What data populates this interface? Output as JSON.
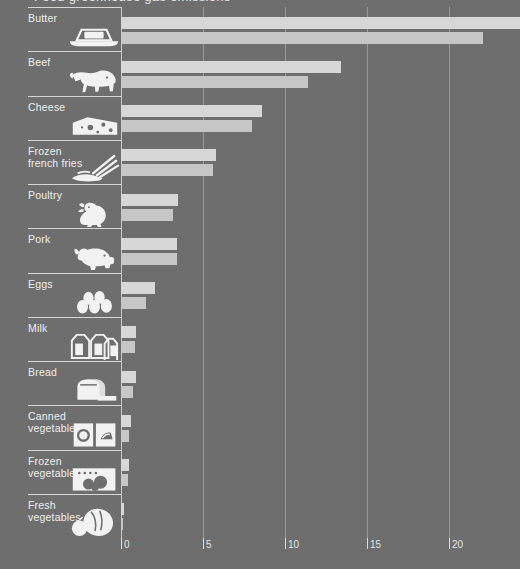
{
  "title": "Food greenhouse gas emissions",
  "axis": {
    "ticks": [
      "0",
      "5",
      "10",
      "15",
      "20"
    ],
    "tick_values": [
      0,
      5,
      10,
      15,
      20
    ],
    "min": 0,
    "max": 24.3
  },
  "colors": {
    "background": "#6e6e6e",
    "series_1": "#d7d7d7",
    "series_2": "#c6c6c6",
    "gridline": "#9a9a9a",
    "baseline": "#c9c9c9",
    "text": "#efefef"
  },
  "chart_data": {
    "type": "bar",
    "orientation": "horizontal",
    "title": "Food greenhouse gas emissions",
    "xlabel": "",
    "ylabel": "",
    "xlim": [
      0,
      24.3
    ],
    "grid": true,
    "legend": "none",
    "categories": [
      "Butter",
      "Beef",
      "Cheese",
      "Frozen\nfrench fries",
      "Poultry",
      "Pork",
      "Eggs",
      "Milk",
      "Bread",
      "Canned\nvegetables",
      "Frozen\nvegetables",
      "Fresh\nvegetables"
    ],
    "icons": [
      "butter-icon",
      "cow-icon",
      "cheese-icon",
      "french-fries-icon",
      "chicken-icon",
      "pig-icon",
      "eggs-icon",
      "milk-cartons-icon",
      "bread-icon",
      "canned-vegetables-icon",
      "frozen-vegetables-icon",
      "fresh-vegetables-icon"
    ],
    "series": [
      {
        "name": "Series 1",
        "values": [
          24.3,
          13.4,
          8.6,
          5.8,
          3.5,
          3.4,
          2.1,
          0.9,
          0.9,
          0.6,
          0.5,
          0.2
        ]
      },
      {
        "name": "Series 2",
        "values": [
          22.1,
          11.4,
          8.0,
          5.6,
          3.2,
          3.4,
          1.5,
          0.85,
          0.75,
          0.5,
          0.45,
          0.15
        ]
      }
    ]
  }
}
